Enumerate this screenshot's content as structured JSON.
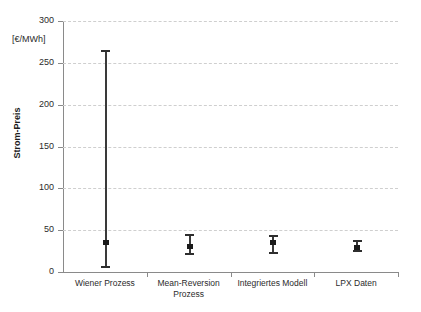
{
  "chart_data": {
    "type": "errorbar",
    "title": "",
    "xlabel": "",
    "ylabel": "Strom-Preis",
    "unit_label": "[€/MWh]",
    "ylim": [
      0,
      300
    ],
    "yticks": [
      0,
      50,
      100,
      150,
      200,
      250,
      300
    ],
    "ytick_labels": [
      "0",
      "50",
      "100",
      "150",
      "200",
      "250",
      "300"
    ],
    "grid": true,
    "grid_axis": "y",
    "legend": "none",
    "categories": [
      "Wiener Prozess",
      "Mean-Reversion Prozess",
      "Integriertes Modell",
      "LPX Daten"
    ],
    "category_label_lines": [
      [
        "Wiener Prozess"
      ],
      [
        "Mean-Reversion",
        "Prozess"
      ],
      [
        "Integriertes Modell"
      ],
      [
        "LPX Daten"
      ]
    ],
    "series": [
      {
        "name": "Strom-Preis",
        "values": [
          35,
          30,
          35,
          29
        ],
        "lower": [
          5,
          20,
          21,
          24
        ],
        "upper": [
          265,
          46,
          44,
          38
        ]
      }
    ],
    "points": [
      {
        "category": "Wiener Prozess",
        "value": 35,
        "low": 5,
        "high": 265
      },
      {
        "category": "Mean-Reversion Prozess",
        "value": 30,
        "low": 20,
        "high": 46
      },
      {
        "category": "Integriertes Modell",
        "value": 35,
        "low": 21,
        "high": 44
      },
      {
        "category": "LPX Daten",
        "value": 29,
        "low": 24,
        "high": 38
      }
    ],
    "colors": {
      "marker": "#1a1a1a",
      "bar": "#3a3a3a",
      "grid": "#cfcfcf",
      "axis": "#8a8a8a",
      "text": "#2b2b2b",
      "background": "#ffffff"
    }
  }
}
